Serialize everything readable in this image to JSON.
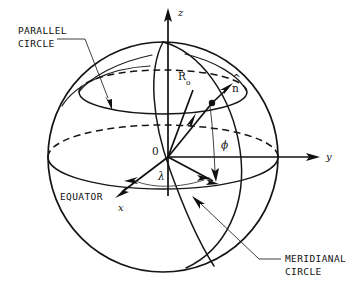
{
  "figure": {
    "background_color": "#ffffff",
    "line_color": "#141414"
  },
  "labels": {
    "parallel_circle_line1": "PARALLEL",
    "parallel_circle_line2": "CIRCLE",
    "equator": "EQUATOR",
    "meridianal_circle_line1": "MERIDIANAL",
    "meridianal_circle_line2": "CIRCLE",
    "axis_z": "z",
    "axis_y": "y",
    "axis_x": "x",
    "origin": "0",
    "radius_symbol": "R",
    "radius_subscript": "o",
    "normal_vector": "n",
    "normal_hat": "^",
    "angle_phi": "ϕ",
    "angle_lambda": "λ"
  },
  "geometry": {
    "sphere_center_x": 163,
    "sphere_center_y": 157,
    "sphere_radius": 115,
    "equator_semi_minor": 32,
    "parallel_circle_center_y": 92,
    "parallel_circle_semi_major": 84,
    "parallel_circle_semi_minor": 22,
    "point_on_sphere_x": 212,
    "point_on_sphere_y": 103
  }
}
